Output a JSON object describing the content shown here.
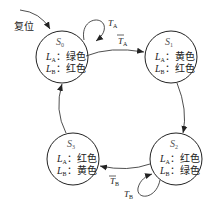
{
  "diagram": {
    "type": "state-transition",
    "reset_label": "复位",
    "states": [
      {
        "id": "S0",
        "name": "S",
        "sub": "0",
        "la_label": "L",
        "la_sub": "A",
        "la_value": "绿色",
        "lb_label": "L",
        "lb_sub": "B",
        "lb_value": "红色"
      },
      {
        "id": "S1",
        "name": "S",
        "sub": "1",
        "la_label": "L",
        "la_sub": "A",
        "la_value": "黄色",
        "lb_label": "L",
        "lb_sub": "B",
        "lb_value": "红色"
      },
      {
        "id": "S2",
        "name": "S",
        "sub": "2",
        "la_label": "L",
        "la_sub": "A",
        "la_value": "红色",
        "lb_label": "L",
        "lb_sub": "B",
        "lb_value": "绿色"
      },
      {
        "id": "S3",
        "name": "S",
        "sub": "3",
        "la_label": "L",
        "la_sub": "A",
        "la_value": "红色",
        "lb_label": "L",
        "lb_sub": "B",
        "lb_value": "黄色"
      }
    ],
    "sep": "：",
    "transitions": [
      {
        "from": "S0",
        "to": "S0",
        "label": "T",
        "sub": "A"
      },
      {
        "from": "S0",
        "to": "S1",
        "label": "T",
        "sub": "A",
        "overline": true
      },
      {
        "from": "S1",
        "to": "S2",
        "label": ""
      },
      {
        "from": "S2",
        "to": "S2",
        "label": "T",
        "sub": "B"
      },
      {
        "from": "S2",
        "to": "S3",
        "label": "T",
        "sub": "B",
        "overline": true
      },
      {
        "from": "S3",
        "to": "S0",
        "label": ""
      }
    ]
  }
}
